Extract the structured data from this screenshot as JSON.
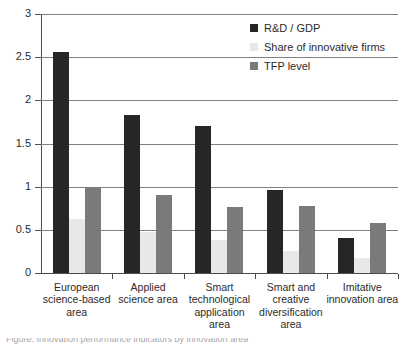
{
  "chart_data": {
    "type": "bar",
    "title": "",
    "xlabel": "",
    "ylabel": "",
    "ylim": [
      0,
      3
    ],
    "grid": true,
    "legend_position": "top-right",
    "y_ticks": [
      "0",
      "0.5",
      "1",
      "1.5",
      "2",
      "2.5",
      "3"
    ],
    "y_tick_values": [
      0,
      0.5,
      1,
      1.5,
      2,
      2.5,
      3
    ],
    "categories": [
      "European science-based area",
      "Applied science area",
      "Smart technological application area",
      "Smart and creative diversification area",
      "Imitative innovation area"
    ],
    "category_lines": [
      [
        "European",
        "science-based",
        "area"
      ],
      [
        "Applied",
        "science area"
      ],
      [
        "Smart",
        "technological",
        "application",
        "area"
      ],
      [
        "Smart and",
        "creative",
        "diversification",
        "area"
      ],
      [
        "Imitative",
        "innovation area"
      ]
    ],
    "series": [
      {
        "name": "R&D / GDP",
        "color": "#262626",
        "values": [
          2.56,
          1.83,
          1.7,
          0.96,
          0.4
        ]
      },
      {
        "name": "Share of innovative firms",
        "color": "#e8e8e8",
        "values": [
          0.62,
          0.47,
          0.38,
          0.26,
          0.17
        ]
      },
      {
        "name": "TFP level",
        "color": "#7a7a7a",
        "values": [
          1.0,
          0.9,
          0.76,
          0.78,
          0.58
        ]
      }
    ]
  },
  "legend": {
    "items": [
      {
        "label": "R&D / GDP",
        "color": "#262626"
      },
      {
        "label": "Share of innovative firms",
        "color": "#e8e8e8"
      },
      {
        "label": "TFP level",
        "color": "#7a7a7a"
      }
    ]
  },
  "caption": {
    "text": "Figure. Innovation performance indicators by innovation area"
  }
}
